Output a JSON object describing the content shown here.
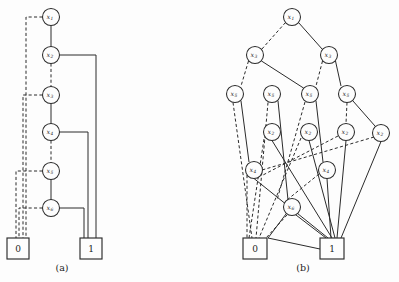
{
  "figure": {
    "background_color": "#fdfdfd",
    "ink_color": "#2b2b2b",
    "width": 399,
    "height": 282
  },
  "panels": [
    {
      "id": "a",
      "caption": "(a)",
      "caption_pos": {
        "x": 62,
        "y": 268
      },
      "nodes": [
        {
          "id": "a1",
          "label": "x",
          "sub": "1",
          "cx": 51,
          "cy": 17,
          "r": 8.5
        },
        {
          "id": "a2",
          "label": "x",
          "sub": "2",
          "cx": 51,
          "cy": 55,
          "r": 8.5
        },
        {
          "id": "a3",
          "label": "x",
          "sub": "3",
          "cx": 51,
          "cy": 95,
          "r": 8.5
        },
        {
          "id": "a4",
          "label": "x",
          "sub": "4",
          "cx": 51,
          "cy": 132,
          "r": 8.5
        },
        {
          "id": "a5",
          "label": "x",
          "sub": "5",
          "cx": 51,
          "cy": 171,
          "r": 8.5
        },
        {
          "id": "a6",
          "label": "x",
          "sub": "6",
          "cx": 51,
          "cy": 208,
          "r": 8.5
        }
      ],
      "terminals": [
        {
          "id": "a0",
          "label": "0",
          "x": 7,
          "y": 238,
          "w": 22,
          "h": 21
        },
        {
          "id": "aT1",
          "label": "1",
          "x": 80,
          "y": 238,
          "w": 22,
          "h": 21
        }
      ],
      "edges_solid": [
        "M51,25.5 L51,46.5",
        "M51,103.5 L51,123.5",
        "M51,179.5 L51,199.5",
        "M59.5,55 L96,55 L96,238",
        "M59.5,132 L88,132 L88,238",
        "M59.5,208 L84,208 L84,238"
      ],
      "edges_dashed": [
        "M42.5,17 L26,17 L26,238",
        "M51,63.5 L51,86.5",
        "M51,140.5 L51,162.5",
        "M42.5,95 L23,95 L23,238",
        "M42.5,171 L16,171 L16,238",
        "M42.5,208 L19,208 L19,238"
      ]
    },
    {
      "id": "b",
      "caption": "(b)",
      "caption_pos": {
        "x": 303,
        "y": 268
      },
      "nodes": [
        {
          "id": "b1",
          "label": "x",
          "sub": "1",
          "cx": 292,
          "cy": 17,
          "r": 8.5
        },
        {
          "id": "b3L",
          "label": "x",
          "sub": "3",
          "cx": 255,
          "cy": 55,
          "r": 8.5
        },
        {
          "id": "b3R",
          "label": "x",
          "sub": "3",
          "cx": 329,
          "cy": 55,
          "r": 8.5
        },
        {
          "id": "b5a",
          "label": "x",
          "sub": "5",
          "cx": 235,
          "cy": 94,
          "r": 8.5
        },
        {
          "id": "b5b",
          "label": "x",
          "sub": "5",
          "cx": 272,
          "cy": 94,
          "r": 8.5
        },
        {
          "id": "b5c",
          "label": "x",
          "sub": "5",
          "cx": 310,
          "cy": 94,
          "r": 8.5
        },
        {
          "id": "b5d",
          "label": "x",
          "sub": "5",
          "cx": 347,
          "cy": 94,
          "r": 8.5
        },
        {
          "id": "b2a",
          "label": "x",
          "sub": "2",
          "cx": 272,
          "cy": 132,
          "r": 8.5
        },
        {
          "id": "b2b",
          "label": "x",
          "sub": "2",
          "cx": 309,
          "cy": 132,
          "r": 8.5
        },
        {
          "id": "b2c",
          "label": "x",
          "sub": "2",
          "cx": 346,
          "cy": 132,
          "r": 8.5
        },
        {
          "id": "b2d",
          "label": "x",
          "sub": "2",
          "cx": 381,
          "cy": 133,
          "r": 8.5
        },
        {
          "id": "b4L",
          "label": "x",
          "sub": "4",
          "cx": 254,
          "cy": 170,
          "r": 8.5
        },
        {
          "id": "b4R",
          "label": "x",
          "sub": "4",
          "cx": 327,
          "cy": 170,
          "r": 8.5
        },
        {
          "id": "b6",
          "label": "x",
          "sub": "6",
          "cx": 292,
          "cy": 207,
          "r": 8.5
        }
      ],
      "terminals": [
        {
          "id": "b0",
          "label": "0",
          "x": 243,
          "y": 238,
          "w": 24,
          "h": 21
        },
        {
          "id": "bT1",
          "label": "1",
          "x": 320,
          "y": 238,
          "w": 24,
          "h": 21
        }
      ],
      "edges_solid": [
        "M298.5,22.5 L322.5,49.5",
        "M261.5,61 L303.5,88",
        "M335.5,61 L341,86",
        "M241,101 L249,162",
        "M278,101 L288,200",
        "M316,101 L323,162",
        "M353,101 L375,126",
        "M272,140.5 L332,238",
        "M309,140.5 L335,238",
        "M346,140.5 L337,238",
        "M381,141.5 L341,238",
        "M254,178.5 L328,238",
        "M327,178.5 L331,238",
        "M286,214 L268,238 L320,249",
        "M296,215 L326,238"
      ],
      "edges_dashed": [
        "M285.5,22.5 L261.5,49.5",
        "M248.5,61 L241,86",
        "M322.5,61 L316,86",
        "M233,102.5 L252,238",
        "M268,102.5 L256,238",
        "M305,102 L277,200",
        "M347,102.5 L346,123.5",
        "M264,139 L249,238",
        "M301,138 L259,238",
        "M338,136 L263,175",
        "M374,137 L262,170",
        "M247,175 L247,238",
        "M319,174 L287,200",
        "M287,215 L266,238"
      ]
    }
  ]
}
